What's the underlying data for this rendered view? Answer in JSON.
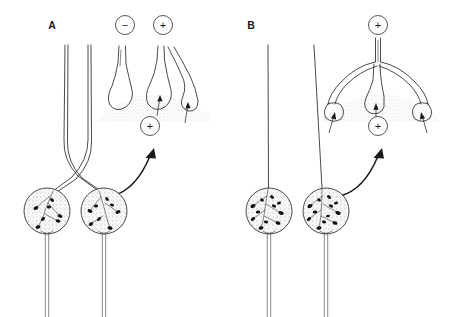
{
  "figure": {
    "background_color": "#ffffff",
    "ink_color": "#2b2b2b",
    "granule_color": "#111111",
    "stipple_color": "#9a9a9a"
  },
  "panels": [
    {
      "id": "A",
      "label": "A",
      "label_x": 52,
      "label_y": 29,
      "description": "Two separate neurons whose dendrites cross and converge; inset shows one non-contacting inhibitory terminal and two contacting excitatory terminals.",
      "neuron_count": 2,
      "dendrites_cross": true,
      "inset": {
        "terminal_count": 3,
        "contacting_terminals": 2,
        "free_terminals": 1
      },
      "signs": [
        {
          "name": "inhibitory-sign-left",
          "symbol": "−",
          "cx": 125,
          "cy": 25,
          "r": 9.5
        },
        {
          "name": "excitatory-sign-right",
          "symbol": "+",
          "cx": 163,
          "cy": 25,
          "r": 9.5
        },
        {
          "name": "excitatory-sign-soma",
          "symbol": "+",
          "cx": 150,
          "cy": 126,
          "r": 9.5
        }
      ],
      "pointer_arrow": {
        "name": "soma-to-inset-arrow",
        "from_x": 112,
        "from_y": 196,
        "to_x": 154,
        "to_y": 150
      }
    },
    {
      "id": "B",
      "label": "B",
      "label_x": 251,
      "label_y": 29,
      "description": "Two separate neurons with parallel dendrites; inset shows a single axon branching into three terminals all contacting the dendritic surface.",
      "neuron_count": 2,
      "dendrites_cross": false,
      "inset": {
        "terminal_count": 3,
        "contacting_terminals": 3,
        "free_terminals": 0
      },
      "signs": [
        {
          "name": "excitatory-sign-top",
          "symbol": "+",
          "cx": 378,
          "cy": 25,
          "r": 9.5
        },
        {
          "name": "excitatory-sign-soma",
          "symbol": "+",
          "cx": 378,
          "cy": 126,
          "r": 9.5
        }
      ],
      "pointer_arrow": {
        "name": "soma-to-inset-arrow",
        "from_x": 340,
        "from_y": 196,
        "to_x": 382,
        "to_y": 150
      }
    }
  ],
  "somas": [
    {
      "name": "soma-a-left",
      "cx": 47,
      "cy": 211,
      "r": 23,
      "granules": 7,
      "panel": "A"
    },
    {
      "name": "soma-a-right",
      "cx": 104,
      "cy": 211,
      "r": 23,
      "granules": 8,
      "panel": "A"
    },
    {
      "name": "soma-b-left",
      "cx": 269,
      "cy": 211,
      "r": 23,
      "granules": 11,
      "panel": "B"
    },
    {
      "name": "soma-b-right",
      "cx": 326,
      "cy": 211,
      "r": 23,
      "granules": 12,
      "panel": "B"
    }
  ],
  "axons": [
    {
      "name": "axon-a-left",
      "x": 47,
      "y_top": 234,
      "y_bottom": 317
    },
    {
      "name": "axon-a-right",
      "x": 104,
      "y_top": 234,
      "y_bottom": 317
    },
    {
      "name": "axon-b-left",
      "x": 269,
      "y_top": 234,
      "y_bottom": 317
    },
    {
      "name": "axon-b-right",
      "x": 326,
      "y_top": 234,
      "y_bottom": 317
    }
  ]
}
